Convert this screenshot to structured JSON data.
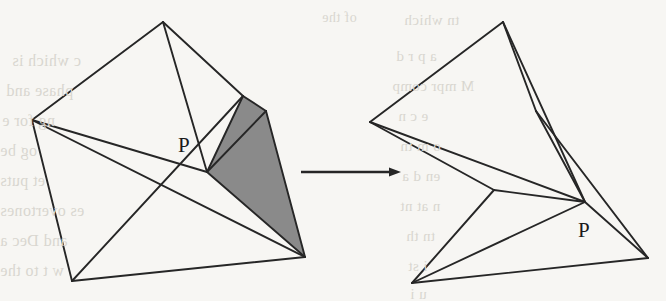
{
  "figure": {
    "type": "geometric-diagram",
    "background_color": "#f7f6f3",
    "ink_color": "#262626",
    "shade_color": "#8a8a8a",
    "bleed_color": "#d9d6d0",
    "labels": {
      "left_vertex_label": "P",
      "right_vertex_label": "P"
    },
    "arrow": {
      "name": "transformation-arrow",
      "x1": 301,
      "y1": 172,
      "x2": 401,
      "y2": 172,
      "direction": "right"
    },
    "left_figure": {
      "name": "mesh-before",
      "vertices": {
        "apex": [
          163,
          22
        ],
        "left": [
          32,
          120
        ],
        "bottom": [
          72,
          281
        ],
        "right": [
          305,
          257
        ],
        "top_shoulder": [
          243,
          96
        ],
        "right_shoulder": [
          266,
          111
        ],
        "hub_P": [
          207,
          172
        ]
      },
      "shaded_polygon": [
        [
          243,
          96
        ],
        [
          266,
          111
        ],
        [
          305,
          257
        ],
        [
          207,
          172
        ]
      ],
      "edges": [
        [
          [
            163,
            22
          ],
          [
            32,
            120
          ]
        ],
        [
          [
            163,
            22
          ],
          [
            243,
            96
          ]
        ],
        [
          [
            163,
            22
          ],
          [
            207,
            172
          ]
        ],
        [
          [
            32,
            120
          ],
          [
            305,
            257
          ]
        ],
        [
          [
            32,
            120
          ],
          [
            207,
            172
          ]
        ],
        [
          [
            32,
            120
          ],
          [
            72,
            281
          ]
        ],
        [
          [
            72,
            281
          ],
          [
            243,
            96
          ]
        ],
        [
          [
            72,
            281
          ],
          [
            305,
            257
          ]
        ],
        [
          [
            243,
            96
          ],
          [
            266,
            111
          ]
        ],
        [
          [
            266,
            111
          ],
          [
            305,
            257
          ]
        ],
        [
          [
            243,
            96
          ],
          [
            207,
            172
          ]
        ],
        [
          [
            266,
            111
          ],
          [
            207,
            172
          ]
        ],
        [
          [
            305,
            257
          ],
          [
            207,
            172
          ]
        ]
      ]
    },
    "right_figure": {
      "name": "mesh-after",
      "vertices": {
        "apex": [
          503,
          22
        ],
        "left": [
          370,
          122
        ],
        "bottom": [
          412,
          283
        ],
        "right": [
          648,
          258
        ],
        "notch": [
          494,
          190
        ],
        "top_shoulder": [
          536,
          111
        ],
        "hub_P": [
          585,
          202
        ]
      },
      "edges": [
        [
          [
            503,
            22
          ],
          [
            370,
            122
          ]
        ],
        [
          [
            503,
            22
          ],
          [
            536,
            111
          ]
        ],
        [
          [
            503,
            22
          ],
          [
            585,
            202
          ]
        ],
        [
          [
            536,
            111
          ],
          [
            585,
            202
          ]
        ],
        [
          [
            536,
            111
          ],
          [
            648,
            258
          ]
        ],
        [
          [
            370,
            122
          ],
          [
            585,
            202
          ]
        ],
        [
          [
            370,
            122
          ],
          [
            494,
            190
          ]
        ],
        [
          [
            494,
            190
          ],
          [
            585,
            202
          ]
        ],
        [
          [
            494,
            190
          ],
          [
            412,
            283
          ]
        ],
        [
          [
            412,
            283
          ],
          [
            585,
            202
          ]
        ],
        [
          [
            412,
            283
          ],
          [
            648,
            258
          ]
        ],
        [
          [
            585,
            202
          ],
          [
            648,
            258
          ]
        ]
      ]
    },
    "bleed_text": [
      {
        "text": "of the",
        "x": 322,
        "y": 10,
        "size": 14
      },
      {
        "text": "c which is",
        "x": 12,
        "y": 52,
        "size": 16
      },
      {
        "text": "phase and",
        "x": 6,
        "y": 82,
        "size": 16
      },
      {
        "text": "ng for e",
        "x": 2,
        "y": 112,
        "size": 16
      },
      {
        "text": "og be",
        "x": 0,
        "y": 142,
        "size": 16
      },
      {
        "text": "et puts",
        "x": 0,
        "y": 172,
        "size": 16
      },
      {
        "text": "es overtones",
        "x": 0,
        "y": 202,
        "size": 16
      },
      {
        "text": "and Dec a",
        "x": 0,
        "y": 232,
        "size": 16
      },
      {
        "text": "w t to the",
        "x": 0,
        "y": 262,
        "size": 16
      },
      {
        "text": "tn which",
        "x": 404,
        "y": 12,
        "size": 15
      },
      {
        "text": "a p r d",
        "x": 396,
        "y": 48,
        "size": 15
      },
      {
        "text": "M mpr comp",
        "x": 392,
        "y": 78,
        "size": 15
      },
      {
        "text": "e c n",
        "x": 398,
        "y": 108,
        "size": 15
      },
      {
        "text": "o m tn",
        "x": 400,
        "y": 138,
        "size": 15
      },
      {
        "text": "en d a",
        "x": 402,
        "y": 168,
        "size": 15
      },
      {
        "text": "n at nt",
        "x": 400,
        "y": 198,
        "size": 15
      },
      {
        "text": "tn th",
        "x": 406,
        "y": 228,
        "size": 15
      },
      {
        "text": "i st",
        "x": 408,
        "y": 258,
        "size": 15
      },
      {
        "text": "u i",
        "x": 410,
        "y": 286,
        "size": 15
      }
    ]
  }
}
